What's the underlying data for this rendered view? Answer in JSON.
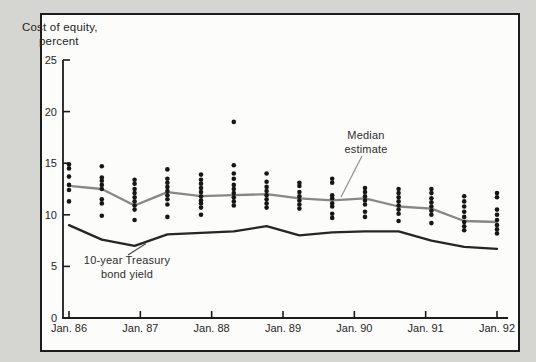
{
  "title": {
    "line1": "Cost of equity,",
    "line2": "percent"
  },
  "annotations": {
    "median_label": {
      "line1": "Median",
      "line2": "estimate"
    },
    "treasury_label": {
      "line1": "10-year Treasury",
      "line2": "bond yield"
    }
  },
  "colors": {
    "background": "#d5d5d1",
    "panel": "#fcfcfa",
    "frame": "#1c1c1c",
    "axis": "#1c1c1c",
    "dot": "#161616",
    "median_line": "#878787",
    "treasury_line": "#262626",
    "callout": "#8f8f8f",
    "text": "#262626"
  },
  "chart_data": {
    "type": "scatter",
    "title": "Cost of equity, percent",
    "xlabel": "",
    "ylabel": "Cost of equity, percent",
    "ylim": [
      0,
      25
    ],
    "yticks": [
      0,
      5,
      10,
      15,
      20,
      25
    ],
    "xlim_years": [
      1986,
      1992
    ],
    "xtick_years": [
      1986,
      1987,
      1988,
      1989,
      1990,
      1991,
      1992
    ],
    "xtick_labels": [
      "Jan. 86",
      "Jan. 87",
      "Jan. 88",
      "Jan. 89",
      "Jan. 90",
      "Jan. 91",
      "Jan. 92"
    ],
    "grid": false,
    "legend_position": "inline-annotations",
    "survey_x_years": [
      1986.0,
      1986.46,
      1986.92,
      1987.38,
      1987.85,
      1988.31,
      1988.77,
      1989.23,
      1989.69,
      1990.15,
      1990.62,
      1991.08,
      1991.54,
      1992.0
    ],
    "series": [
      {
        "name": "Individual cost-of-equity estimates",
        "type": "scatter",
        "points_by_survey": [
          [
            14.9,
            14.5,
            13.7,
            12.9,
            12.4,
            11.3
          ],
          [
            14.7,
            13.6,
            13.3,
            12.9,
            12.5,
            11.5,
            11.1,
            9.9
          ],
          [
            13.4,
            13.0,
            12.5,
            12.1,
            11.7,
            11.3,
            10.9,
            10.5,
            9.5
          ],
          [
            14.4,
            13.5,
            13.1,
            12.7,
            12.3,
            11.9,
            11.5,
            11.0,
            9.8
          ],
          [
            13.9,
            13.4,
            13.0,
            12.6,
            12.2,
            11.8,
            11.4,
            11.1,
            10.7,
            10.0
          ],
          [
            19.0,
            14.8,
            14.0,
            13.5,
            12.9,
            12.5,
            12.1,
            11.7,
            11.3,
            10.9
          ],
          [
            14.0,
            13.2,
            12.7,
            12.3,
            11.9,
            11.5,
            11.1,
            10.7
          ],
          [
            13.1,
            12.8,
            12.2,
            11.8,
            11.4,
            11.0,
            10.6
          ],
          [
            13.5,
            13.1,
            11.9,
            11.6,
            11.1,
            10.8,
            10.1,
            9.7
          ],
          [
            12.6,
            12.2,
            11.8,
            11.4,
            11.0,
            10.3,
            9.8
          ],
          [
            12.5,
            12.1,
            11.7,
            11.3,
            10.9,
            10.5,
            10.1,
            9.4
          ],
          [
            12.5,
            12.1,
            11.6,
            11.2,
            10.8,
            10.4,
            10.0,
            9.2
          ],
          [
            11.8,
            11.3,
            10.8,
            10.3,
            9.8,
            9.3,
            8.9,
            8.5
          ],
          [
            12.1,
            11.7,
            10.5,
            10.0,
            9.5,
            9.0,
            8.6,
            8.2
          ]
        ]
      },
      {
        "name": "Median estimate",
        "type": "line",
        "values": [
          12.8,
          12.5,
          10.9,
          12.2,
          11.8,
          11.9,
          12.0,
          11.6,
          11.4,
          11.6,
          10.8,
          10.6,
          9.4,
          9.3
        ]
      },
      {
        "name": "10-year Treasury bond yield",
        "type": "line",
        "values": [
          9.0,
          7.6,
          7.0,
          8.1,
          8.25,
          8.4,
          8.9,
          8.0,
          8.3,
          8.4,
          8.4,
          7.5,
          6.9,
          6.7
        ]
      }
    ]
  }
}
